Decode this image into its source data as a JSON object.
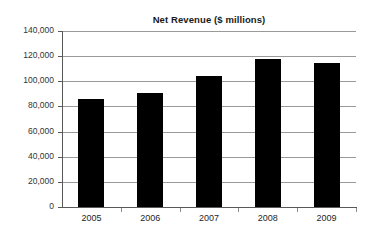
{
  "chart_data": {
    "type": "bar",
    "title": "Net Revenue ($ millions)",
    "xlabel": "",
    "ylabel": "",
    "categories": [
      "2005",
      "2006",
      "2007",
      "2008",
      "2009"
    ],
    "values": [
      86000,
      91000,
      104500,
      118000,
      114500
    ],
    "series": [
      {
        "name": "Net Revenue",
        "values": [
          86000,
          91000,
          104500,
          118000,
          114500
        ]
      }
    ],
    "ylim": [
      0,
      140000
    ],
    "ytick_values": [
      0,
      20000,
      40000,
      60000,
      80000,
      100000,
      120000,
      140000
    ],
    "ytick_labels": [
      "0",
      "20,000",
      "40,000",
      "60,000",
      "80,000",
      "100,000",
      "120,000",
      "140,000"
    ],
    "grid": true,
    "grid_axis": "y",
    "legend": false,
    "bar_color": "#000000",
    "grid_color": "#9a9a9a",
    "axis_color": "#595959",
    "background_color": "#ffffff"
  }
}
